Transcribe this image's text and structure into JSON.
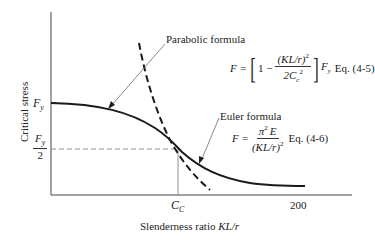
{
  "diagram": {
    "y_axis_label": "Critical stress",
    "x_axis_label_text": "Slenderness ratio ",
    "x_axis_label_var": "KL/r",
    "y_ticks": {
      "fy": "F",
      "fy_sub": "y",
      "fy_half_num": "F",
      "fy_half_num_sub": "y",
      "fy_half_den": "2"
    },
    "x_ticks": {
      "cc": "C",
      "cc_sub": "C",
      "max": "200"
    },
    "parabolic": {
      "label": "Parabolic formula",
      "lhs": "F =",
      "one_minus": "1 −",
      "num": "(KL/r)",
      "num_sup": "2",
      "den": "2C",
      "den_sub": "c",
      "den_sup": "2",
      "factor": "F",
      "factor_sub": "y",
      "eq": "Eq. (4-5)"
    },
    "euler": {
      "label": "Euler formula",
      "lhs": "F =",
      "num": "π",
      "num_sup": "2",
      "num_e": "E",
      "den": "(KL/r)",
      "den_sup": "2",
      "eq": "Eq. (4-6)"
    },
    "colors": {
      "line": "#1a1a1a",
      "axis": "#444444",
      "guide": "#777777"
    }
  }
}
